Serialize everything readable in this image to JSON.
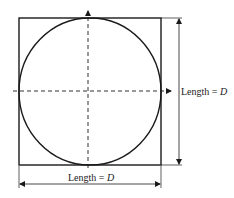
{
  "diagram": {
    "colors": {
      "line": "#1a1a1a",
      "background": "#ffffff"
    },
    "square": {
      "x": 19,
      "y": 18,
      "width": 142,
      "height": 147
    },
    "circle": {
      "cx": 90,
      "cy": 91.5,
      "rx": 71,
      "ry": 73.5
    },
    "axes": {
      "vertical": {
        "x": 88,
        "y1": 10,
        "y2": 168,
        "style": "dashed",
        "arrow": "up"
      },
      "horizontal": {
        "y": 91,
        "x1": 13,
        "x2": 172,
        "style": "dashed",
        "arrow": "right"
      }
    },
    "dimensions": {
      "width": {
        "label_prefix": "Length = ",
        "label_var": "D",
        "y": 184
      },
      "height": {
        "label_prefix": "Length = ",
        "label_var": "D",
        "x": 179
      }
    }
  }
}
